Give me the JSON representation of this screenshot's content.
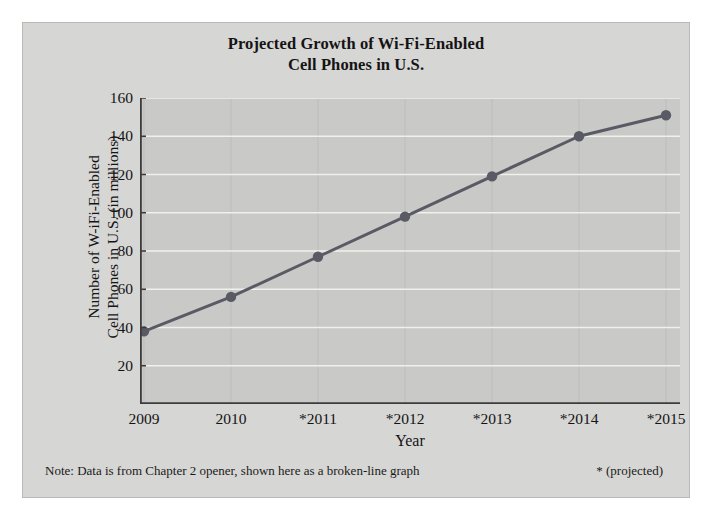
{
  "figure": {
    "title_line1": "Projected Growth of Wi-Fi-Enabled",
    "title_line2": "Cell Phones in U.S.",
    "footer_note": "Note: Data is from Chapter 2 opener, shown here as a broken-line graph",
    "footer_legend": "* (projected)",
    "panel_color": "#d6d6d4",
    "plot_color": "#c9c9c7",
    "line_color": "#5a5a64",
    "gridline_color": "#f0f0ee",
    "axis_color": "#3c3c3c"
  },
  "chart_data": {
    "type": "line",
    "title": "Projected Growth of Wi-Fi-Enabled Cell Phones in U.S.",
    "xlabel": "Year",
    "ylabel_line1": "Number of W-iFi-Enabled",
    "ylabel_line2": "Cell Phones in U.S. (in millions)",
    "categories": [
      "2009",
      "2010",
      "*2011",
      "*2012",
      "*2013",
      "*2014",
      "*2015"
    ],
    "values": [
      38,
      56,
      77,
      98,
      119,
      140,
      151
    ],
    "yticks": [
      20,
      40,
      60,
      80,
      100,
      120,
      140,
      160
    ],
    "ylim": [
      0,
      160
    ],
    "grid": "horizontal-and-vertical",
    "legend": "none",
    "markers": "filled-circle",
    "annotation": "* (projected)"
  }
}
